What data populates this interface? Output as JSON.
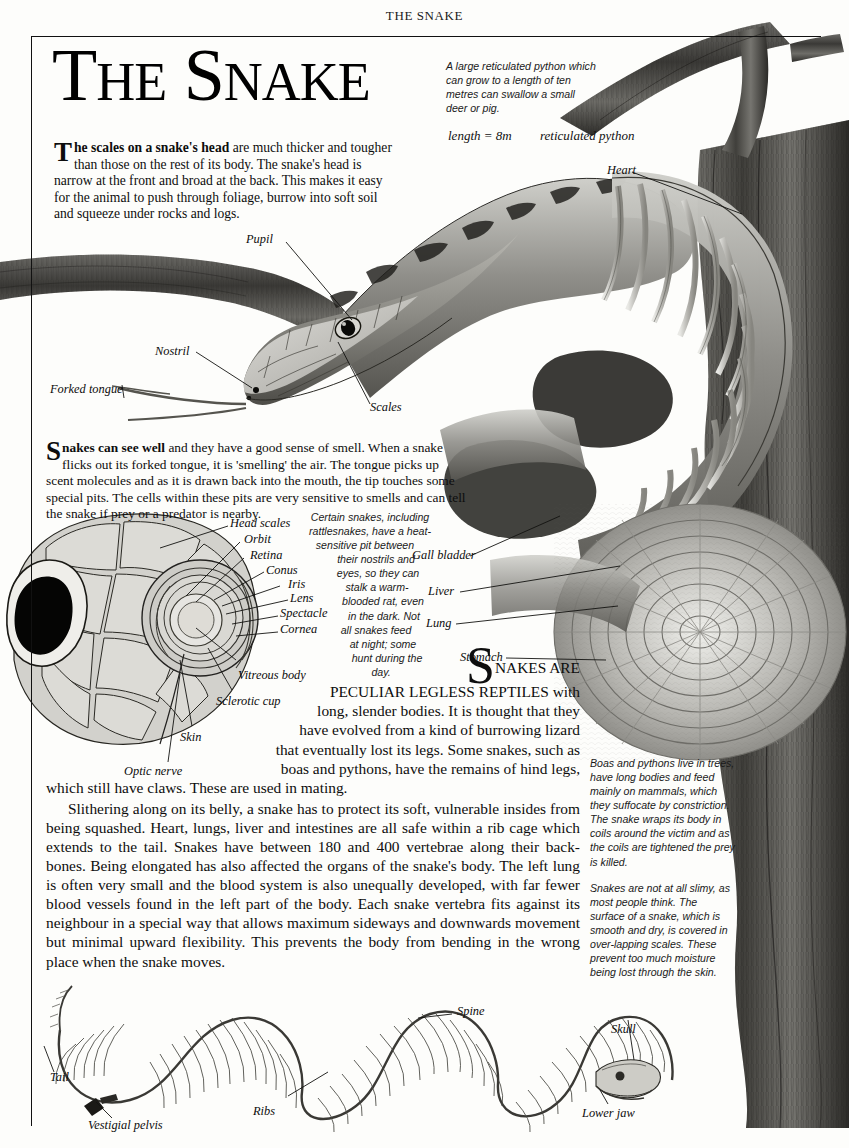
{
  "page": {
    "running_head": "THE SNAKE",
    "title_words": [
      "The",
      "Snake"
    ],
    "title_full": "THE SNAKE"
  },
  "title": {
    "t1_cap": "T",
    "t1_rest": "HE",
    "t2_cap": "S",
    "t2_rest": "NAKE"
  },
  "paragraphs": {
    "lead_drop": "T",
    "lead_bold": "he scales on a snake's head",
    "lead_rest": " are much thicker and tougher than those on the rest of its body. The snake's head is narrow at the front and broad at the back. This makes it easy for the animal to push through foliage, burrow into soft soil and squeeze under rocks and logs.",
    "see_drop": "S",
    "see_bold": "nakes can see well",
    "see_rest": " and they have a good sense of smell. When a snake flicks out its forked tongue, it is 'smelling' the air. The tongue picks up scent molecules and as it is drawn back into the mouth, the tip touches some special pits. The cells within these pits are very sensitive to smells and can tell the snake if prey or a predator is nearby.",
    "main_drop": "S",
    "main_lines": [
      "NAKES ARE",
      "PECULIAR LEGLESS REPTILES with",
      "long, slender bodies. It is thought that they",
      "have evolved from a kind of burrowing lizard",
      "that eventually lost its legs. Some snakes, such as",
      "boas and pythons, have the remains of hind legs,",
      "which still have claws. These are used in mating."
    ],
    "main_second": "Slithering along on its belly, a snake has to protect its soft, vulnerable insides from  being squashed. Heart, lungs, liver and intestines are all safe within a rib cage which extends to the tail. Snakes have between 180 and 400 vertebrae along their back-bones. Being elongated has also affected the organs of the snake's body. The left lung is often very small and the blood system is also unequally developed, with far fewer blood vessels found in the left part of the body. Each snake vertebra fits against its neighbour in a special way that allows maximum sideways and downwards movement but minimal upward flexibility. This prevents the body from  bending in the wrong place when the snake moves."
  },
  "captions": {
    "python": "A large reticulated python which can grow to a length of ten metres can swallow a small deer or pig.",
    "length": "length = 8m",
    "species": "reticulated python",
    "boa": "Boas and pythons live in trees, have long bodies and feed mainly on mammals, which they suffocate by constriction. The snake wraps its body in coils around the victim and as the coils are tightened   the prey is killed.",
    "skin": "Snakes are not at all slimy, as most people think. The surface of a snake, which is smooth and dry, is covered in over-lapping scales. These prevent too much moisture  being lost through the skin.",
    "pit_lines": [
      "Certain snakes, including",
      "rattlesnakes, have a heat-",
      "sensitive pit between",
      "their nostrils and",
      "eyes, so they can",
      "stalk a warm-",
      "blooded rat, even",
      "in the dark. Not",
      "all snakes feed",
      "at night; some",
      "hunt during the",
      "day."
    ]
  },
  "labels": {
    "head_pupil": "Pupil",
    "head_nostril": "Nostril",
    "head_forked_tongue": "Forked tongue",
    "head_scales": "Scales",
    "organ_heart": "Heart",
    "organ_gall_bladder": "Gall bladder",
    "organ_liver": "Liver",
    "organ_lung": "Lung",
    "organ_stomach": "Stomach",
    "eye_head_scales": "Head scales",
    "eye_orbit": "Orbit",
    "eye_retina": "Retina",
    "eye_conus": "Conus",
    "eye_iris": "Iris",
    "eye_lens": "Lens",
    "eye_spectacle": "Spectacle",
    "eye_cornea": "Cornea",
    "eye_vitreous_body": "Vitreous body",
    "eye_sclerotic_cup": "Sclerotic cup",
    "eye_skin": "Skin",
    "eye_optic_nerve": "Optic nerve",
    "skel_spine": "Spine",
    "skel_skull": "Skull",
    "skel_lower_jaw": "Lower jaw",
    "skel_tail": "Tail",
    "skel_ribs": "Ribs",
    "skel_vestigial_pelvis": "Vestigial pelvis"
  },
  "colors": {
    "ink": "#0d0d0d",
    "rule": "#111111",
    "paper": "#fdfdfb",
    "pencil_mid": "#9a9a96",
    "pencil_dark": "#4a4a48",
    "pencil_light": "#d6d6d2"
  }
}
